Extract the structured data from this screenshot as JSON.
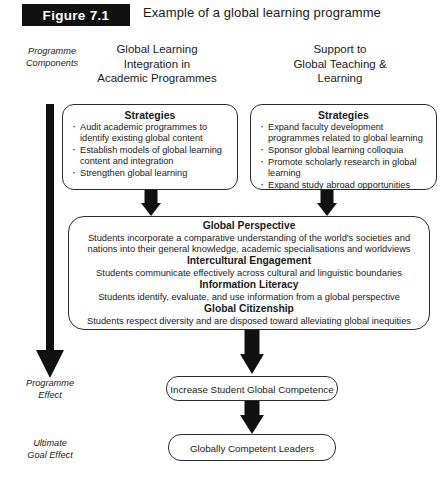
{
  "figure": {
    "label": "Figure 7.1",
    "caption": "Example of a global learning programme"
  },
  "side_labels": {
    "programme_components": "Programme\nComponents",
    "programme_effect": "Programme\nEffect",
    "ultimate_goal_effect": "Ultimate\nGoal Effect"
  },
  "columns": {
    "left_heading": "Global Learning\nIntegration in\nAcademic Programmes",
    "right_heading": "Support to\nGlobal Teaching &\nLearning"
  },
  "strategies_left": {
    "title": "Strategies",
    "items": [
      "Audit academic programmes to identify existing global content",
      "Establish models of global learning content and integration",
      "Strengthen global learning"
    ]
  },
  "strategies_right": {
    "title": "Strategies",
    "items": [
      "Expand faculty development programmes related to global learning",
      "Sponsor global learning colloquia",
      "Promote scholarly research in global learning",
      "Expand study abroad opportunities"
    ]
  },
  "outcomes": [
    {
      "title": "Global Perspective",
      "description": "Students incorporate a comparative understanding of the world's societies and nations into their general knowledge, academic specialisations and worldviews"
    },
    {
      "title": "Intercultural Engagement",
      "description": "Students communicate effectively across cultural and linguistic boundaries"
    },
    {
      "title": "Information Literacy",
      "description": "Students identify, evaluate, and use information from a global perspective"
    },
    {
      "title": "Global Citizenship",
      "description": "Students respect diversity and are disposed toward alleviating global inequities"
    }
  ],
  "effects": {
    "competence": "Increase Student Global Competence",
    "leaders": "Globally Competent Leaders"
  },
  "colors": {
    "ink": "#111111",
    "label_bg": "#111111",
    "label_fg": "#ffffff",
    "box_border": "#2b2b2b",
    "background": "#ffffff"
  }
}
